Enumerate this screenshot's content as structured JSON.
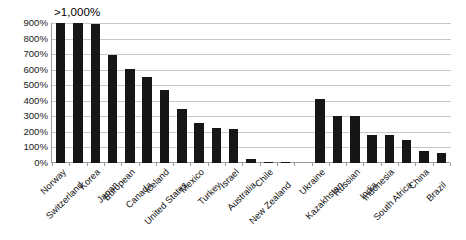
{
  "chart_data": {
    "type": "bar",
    "title": "",
    "subtitle": "",
    "xlabel": "",
    "ylabel": "",
    "annotation": ">1,000%",
    "ylim": [
      0,
      900
    ],
    "ytick_labels": [
      "900%",
      "800%",
      "700%",
      "600%",
      "500%",
      "400%",
      "300%",
      "200%",
      "100%",
      "0%"
    ],
    "ytick_values": [
      900,
      800,
      700,
      600,
      500,
      400,
      300,
      200,
      100,
      0
    ],
    "grid": true,
    "legend": "none",
    "bar_color": "#161616",
    "categories": [
      "Norway",
      "Switzerland",
      "Korea",
      "Japan",
      "European",
      "Canada",
      "Iceland",
      "United States",
      "Mexico",
      "Turkey",
      "Israel",
      "Australia",
      "Chile",
      "New Zealand",
      "",
      "Ukraine",
      "Kazakhstan",
      "Russian",
      "India",
      "Indonesia",
      "South Africa",
      "China",
      "Brazil"
    ],
    "values": [
      900,
      900,
      895,
      695,
      605,
      550,
      470,
      350,
      255,
      225,
      220,
      25,
      6,
      6,
      0,
      410,
      300,
      300,
      180,
      180,
      150,
      75,
      65
    ],
    "capped_categories": [
      "Norway",
      "Switzerland",
      "Korea"
    ],
    "label_tiers": [
      1,
      2,
      1,
      2,
      1,
      2,
      1,
      2,
      1,
      2,
      1,
      2,
      1,
      2,
      1,
      1,
      2,
      1,
      2,
      1,
      2,
      1,
      2
    ]
  }
}
